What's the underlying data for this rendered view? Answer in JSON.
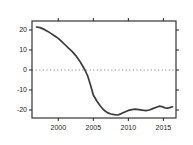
{
  "chart_data": {
    "type": "line",
    "title": "",
    "xlabel": "",
    "ylabel": "",
    "xlim": [
      1996.25,
      2016.8
    ],
    "ylim": [
      -24,
      24.5
    ],
    "x_ticks": [
      2000,
      2005,
      2010,
      2015
    ],
    "y_ticks": [
      -20,
      -10,
      0,
      10,
      20
    ],
    "grid": false,
    "legend": "none",
    "zero_line": {
      "y": 0,
      "style": "dotted",
      "color": "#7a7a7a"
    },
    "series": [
      {
        "name": "smoothed-curve",
        "color": "#3b3b3b",
        "x": [
          1996.9,
          1997.4,
          1998.0,
          1998.5,
          1999.0,
          1999.5,
          2000.0,
          2000.5,
          2001.0,
          2001.5,
          2002.0,
          2002.5,
          2003.0,
          2003.4,
          2003.8,
          2004.2,
          2004.6,
          2005.0,
          2005.5,
          2006.0,
          2006.5,
          2007.0,
          2007.5,
          2008.0,
          2008.5,
          2009.0,
          2009.5,
          2010.0,
          2010.5,
          2011.0,
          2011.5,
          2012.0,
          2012.5,
          2013.0,
          2013.5,
          2014.0,
          2014.4,
          2014.8,
          2015.2,
          2015.6,
          2016.0,
          2016.3
        ],
        "y": [
          21.5,
          21.2,
          20.3,
          19.3,
          18.2,
          17.0,
          15.8,
          14.2,
          12.5,
          10.8,
          9.2,
          7.2,
          4.8,
          2.5,
          0.0,
          -3.0,
          -7.5,
          -12.5,
          -15.5,
          -18.0,
          -20.0,
          -21.3,
          -22.0,
          -22.3,
          -22.5,
          -21.8,
          -21.0,
          -20.2,
          -19.8,
          -19.6,
          -19.8,
          -20.1,
          -20.3,
          -20.0,
          -19.3,
          -18.6,
          -18.1,
          -18.3,
          -18.9,
          -19.1,
          -18.7,
          -18.4
        ]
      }
    ],
    "layout": {
      "plot_box": {
        "left": 32,
        "right": 176,
        "top": 21,
        "bottom": 118
      },
      "tick_length": 3,
      "ticks_on_sides": [
        "bottom",
        "top",
        "left",
        "right"
      ],
      "axis_color": "#222222",
      "label_color": "#222222",
      "label_font_size": 7,
      "background": "#ffffff"
    }
  }
}
